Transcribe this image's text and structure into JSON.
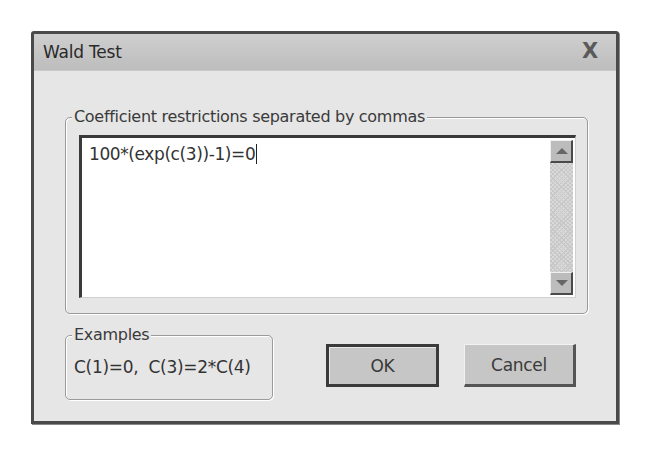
{
  "dialog": {
    "title": "Wald Test",
    "close_glyph": "X"
  },
  "restrictions": {
    "label": "Coefficient restrictions separated by commas",
    "value": "100*(exp(c(3))-1)=0"
  },
  "examples": {
    "label": "Examples",
    "text": "C(1)=0,  C(3)=2*C(4)"
  },
  "buttons": {
    "ok_label": "OK",
    "cancel_label": "Cancel"
  },
  "colors": {
    "dialog_bg": "#e6e6e6",
    "titlebar_bg": "#c6c6c6",
    "border": "#4a4a4a",
    "button_bg": "#c6c6c6"
  }
}
